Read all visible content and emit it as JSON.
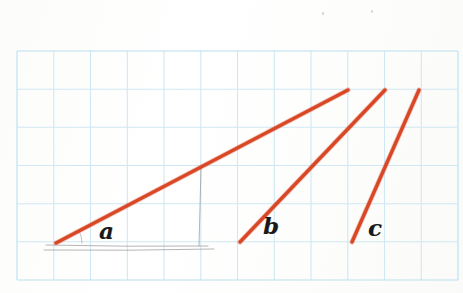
{
  "figure": {
    "kind": "hand-drawn-graph-paper-figure",
    "canvas": {
      "width": 463,
      "height": 293
    },
    "background_color": "#fefefe"
  },
  "grid": {
    "name": "graph-paper-grid",
    "line_color": "#cfe8f3",
    "line_color_strong": "#b9dff0",
    "stroke_width": 1.1,
    "left": 17,
    "top": 51,
    "right": 458,
    "bottom": 280,
    "columns": 12,
    "rows": 6,
    "cell_width": 36.75,
    "cell_height": 38.17,
    "x_positions": [
      17,
      53.8,
      90.5,
      127.3,
      164,
      200.8,
      237.5,
      274.3,
      311,
      347.8,
      384.5,
      421.3,
      458
    ],
    "y_positions": [
      51,
      89.2,
      127.3,
      165.5,
      203.7,
      241.8,
      280
    ]
  },
  "ink": {
    "color": "#e04a28",
    "color_core": "#d8421f",
    "stroke_width": 3.4,
    "linecap": "round"
  },
  "pencil": {
    "color": "#8c8d8f",
    "stroke_width": 0.9,
    "opacity": 0.72
  },
  "lines": [
    {
      "id": "line-a",
      "label": "a",
      "color": "#e04a28",
      "start": {
        "x": 56,
        "y": 243
      },
      "end": {
        "x": 348,
        "y": 90
      },
      "run": 292,
      "rise": 153,
      "slope": 0.524,
      "grid_run": 8,
      "grid_rise": 4,
      "steepness": "shallow",
      "label_pos": {
        "x": 99,
        "y": 219
      },
      "label_size": 23
    },
    {
      "id": "line-b",
      "label": "b",
      "color": "#e04a28",
      "start": {
        "x": 240,
        "y": 242
      },
      "end": {
        "x": 385,
        "y": 90
      },
      "run": 145,
      "rise": 152,
      "slope": 1.048,
      "grid_run": 4,
      "grid_rise": 4,
      "steepness": "medium",
      "label_pos": {
        "x": 263,
        "y": 214
      },
      "label_size": 23
    },
    {
      "id": "line-c",
      "label": "c",
      "color": "#e04a28",
      "start": {
        "x": 352,
        "y": 242
      },
      "end": {
        "x": 419,
        "y": 90
      },
      "run": 67,
      "rise": 152,
      "slope": 2.269,
      "grid_run": 1.8,
      "grid_rise": 4,
      "steepness": "steep",
      "label_pos": {
        "x": 368,
        "y": 216
      },
      "label_size": 23
    }
  ],
  "pencil_marks": [
    {
      "id": "pencil-baseline",
      "description": "faint horizontal baseline under line a",
      "from": {
        "x": 46,
        "y": 245
      },
      "to": {
        "x": 208,
        "y": 246
      }
    },
    {
      "id": "pencil-baseline-lower",
      "description": "second fainter horizontal sweep",
      "from": {
        "x": 44,
        "y": 250
      },
      "to": {
        "x": 214,
        "y": 249
      }
    },
    {
      "id": "pencil-angle-arc",
      "description": "small angle arc at vertex of line a",
      "vertex": {
        "x": 56,
        "y": 243
      },
      "radius": 26
    },
    {
      "id": "pencil-vertical",
      "description": "faint vertical drop from line a to baseline",
      "from": {
        "x": 201,
        "y": 168
      },
      "to": {
        "x": 199,
        "y": 246
      }
    }
  ],
  "specks": [
    {
      "id": "speck-1",
      "x": 322,
      "y": 12,
      "size": 2.4
    },
    {
      "id": "speck-2",
      "x": 371,
      "y": 10,
      "size": 2.0
    }
  ]
}
